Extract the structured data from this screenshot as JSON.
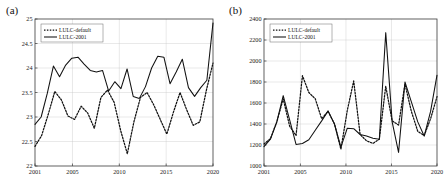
{
  "figure": {
    "panels": [
      {
        "label": "(a)",
        "name": "panel-a",
        "legend": {
          "entries": [
            {
              "label": "LULC-default",
              "style": "dotted"
            },
            {
              "label": "LULC-2001",
              "style": "solid"
            }
          ]
        },
        "chart_data": {
          "type": "line",
          "title": "",
          "xlabel": "",
          "ylabel": "",
          "xlim": [
            2001,
            2020
          ],
          "ylim": [
            22,
            25
          ],
          "yticks": [
            22,
            22.5,
            23,
            23.5,
            24,
            24.5,
            25
          ],
          "ytick_labels": [
            "22",
            "22.5",
            "23",
            "23.5",
            "24",
            "24.5",
            "25"
          ],
          "xticks": [
            2001,
            2005,
            2010,
            2015,
            2020
          ],
          "xtick_labels": [
            "2001",
            "2005",
            "2010",
            "2015",
            "2020"
          ],
          "grid": true,
          "legend_position": "top-left",
          "x": [
            2001,
            2002,
            2003,
            2004,
            2005,
            2006,
            2007,
            2008,
            2009,
            2010,
            2011,
            2012,
            2013,
            2014,
            2015,
            2016,
            2017,
            2018,
            2019,
            2020
          ],
          "series": [
            {
              "name": "LULC-default",
              "style": "dotted",
              "values": [
                22.4,
                22.62,
                23.05,
                23.52,
                23.35,
                23.02,
                22.95,
                23.22,
                23.08,
                22.77,
                23.4,
                23.55,
                23.3,
                22.72,
                22.25,
                22.9,
                23.4,
                23.5,
                23.25,
                22.95,
                22.65,
                23.1,
                23.5,
                23.15,
                22.83,
                22.9,
                23.55,
                24.1
              ]
            },
            {
              "name": "LULC-2001",
              "style": "solid",
              "values": [
                22.85,
                23.0,
                23.48,
                24.04,
                23.82,
                24.06,
                24.2,
                24.22,
                24.08,
                23.95,
                23.92,
                23.95,
                23.53,
                23.72,
                23.58,
                23.98,
                23.42,
                23.38,
                23.62,
                24.0,
                24.24,
                24.22,
                23.68,
                23.92,
                24.18,
                23.6,
                23.42,
                23.6,
                23.75,
                24.92
              ]
            }
          ]
        }
      },
      {
        "label": "(b)",
        "name": "panel-b",
        "legend": {
          "entries": [
            {
              "label": "LULC-default",
              "style": "dotted"
            },
            {
              "label": "LULC-2001",
              "style": "solid"
            }
          ]
        },
        "chart_data": {
          "type": "line",
          "title": "",
          "xlabel": "",
          "ylabel": "",
          "xlim": [
            2001,
            2020
          ],
          "ylim": [
            1000,
            2400
          ],
          "yticks": [
            1000,
            1200,
            1400,
            1600,
            1800,
            2000,
            2200,
            2400
          ],
          "ytick_labels": [
            "1000",
            "1200",
            "1400",
            "1600",
            "1800",
            "2000",
            "2200",
            "2400"
          ],
          "xticks": [
            2001,
            2005,
            2010,
            2015,
            2020
          ],
          "xtick_labels": [
            "2001",
            "2005",
            "2010",
            "2015",
            "2020"
          ],
          "grid": true,
          "legend_position": "top-left",
          "x": [
            2001,
            2002,
            2003,
            2004,
            2005,
            2006,
            2007,
            2008,
            2009,
            2010,
            2011,
            2012,
            2013,
            2014,
            2015,
            2016,
            2017,
            2018,
            2019,
            2020
          ],
          "series": [
            {
              "name": "LULC-default",
              "style": "dotted",
              "values": [
                1210,
                1260,
                1420,
                1640,
                1380,
                1290,
                1860,
                1700,
                1640,
                1450,
                1520,
                1400,
                1160,
                1530,
                1810,
                1300,
                1240,
                1215,
                1255,
                1760,
                1430,
                1390,
                1780,
                1520,
                1330,
                1290,
                1450,
                1660
              ]
            },
            {
              "name": "LULC-2001",
              "style": "solid",
              "values": [
                1185,
                1255,
                1420,
                1670,
                1440,
                1205,
                1215,
                1250,
                1340,
                1430,
                1525,
                1400,
                1180,
                1360,
                1355,
                1300,
                1285,
                1265,
                1255,
                2270,
                1420,
                1130,
                1800,
                1610,
                1420,
                1285,
                1520,
                1865
              ]
            }
          ]
        }
      }
    ]
  }
}
